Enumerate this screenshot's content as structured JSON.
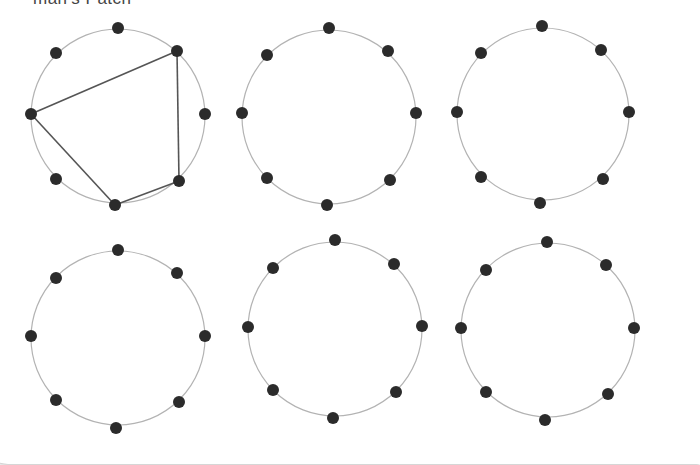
{
  "caption": "man's Patch",
  "style": {
    "circle_stroke": "#b3b3b3",
    "dot_fill": "#2b2b2b",
    "edge_stroke": "#555555",
    "dot_radius": 6
  },
  "diagrams": [
    {
      "name": "circle-1",
      "center": [
        118,
        116
      ],
      "radius": 87,
      "nodes": [
        [
          118,
          28
        ],
        [
          177,
          51
        ],
        [
          205,
          114
        ],
        [
          179,
          181
        ],
        [
          115,
          205
        ],
        [
          56,
          179
        ],
        [
          31,
          114
        ],
        [
          56,
          53
        ]
      ],
      "edges": [
        [
          6,
          1
        ],
        [
          1,
          3
        ],
        [
          3,
          4
        ],
        [
          4,
          6
        ]
      ]
    },
    {
      "name": "circle-2",
      "center": [
        329,
        117
      ],
      "radius": 87,
      "nodes": [
        [
          329,
          28
        ],
        [
          388,
          51
        ],
        [
          416,
          113
        ],
        [
          390,
          180
        ],
        [
          327,
          205
        ],
        [
          267,
          178
        ],
        [
          242,
          113
        ],
        [
          267,
          55
        ]
      ],
      "edges": []
    },
    {
      "name": "circle-3",
      "center": [
        543,
        114
      ],
      "radius": 86,
      "nodes": [
        [
          542,
          26
        ],
        [
          601,
          50
        ],
        [
          629,
          112
        ],
        [
          603,
          179
        ],
        [
          540,
          203
        ],
        [
          481,
          177
        ],
        [
          457,
          112
        ],
        [
          481,
          53
        ]
      ],
      "edges": []
    },
    {
      "name": "circle-4",
      "center": [
        118,
        338
      ],
      "radius": 87,
      "nodes": [
        [
          118,
          250
        ],
        [
          177,
          273
        ],
        [
          205,
          336
        ],
        [
          179,
          402
        ],
        [
          116,
          428
        ],
        [
          56,
          400
        ],
        [
          31,
          336
        ],
        [
          56,
          278
        ]
      ],
      "edges": []
    },
    {
      "name": "circle-5",
      "center": [
        335,
        329
      ],
      "radius": 87,
      "nodes": [
        [
          335,
          240
        ],
        [
          394,
          264
        ],
        [
          422,
          326
        ],
        [
          396,
          392
        ],
        [
          333,
          418
        ],
        [
          273,
          390
        ],
        [
          248,
          327
        ],
        [
          273,
          268
        ]
      ],
      "edges": []
    },
    {
      "name": "circle-6",
      "center": [
        548,
        330
      ],
      "radius": 87,
      "nodes": [
        [
          547,
          242
        ],
        [
          606,
          265
        ],
        [
          634,
          328
        ],
        [
          608,
          394
        ],
        [
          545,
          420
        ],
        [
          486,
          392
        ],
        [
          461,
          328
        ],
        [
          486,
          270
        ]
      ],
      "edges": []
    }
  ]
}
